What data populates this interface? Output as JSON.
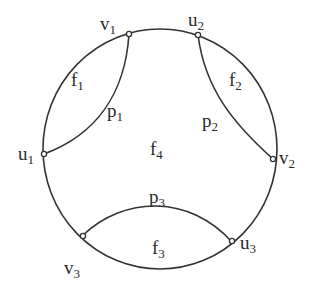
{
  "diagram": {
    "type": "planar graph on a circle",
    "outer_boundary": "circle",
    "colors": {
      "stroke": "#333333",
      "background": "#ffffff",
      "text": "#2a2a2a"
    },
    "nodes": [
      {
        "id": "v1",
        "base": "v",
        "sub": "1"
      },
      {
        "id": "u2",
        "base": "u",
        "sub": "2"
      },
      {
        "id": "u1",
        "base": "u",
        "sub": "1"
      },
      {
        "id": "v2",
        "base": "v",
        "sub": "2"
      },
      {
        "id": "v3",
        "base": "v",
        "sub": "3"
      },
      {
        "id": "u3",
        "base": "u",
        "sub": "3"
      }
    ],
    "paths": [
      {
        "id": "p1",
        "base": "p",
        "sub": "1",
        "from": "u1",
        "to": "v1"
      },
      {
        "id": "p2",
        "base": "p",
        "sub": "2",
        "from": "u2",
        "to": "v2"
      },
      {
        "id": "p3",
        "base": "p",
        "sub": "3",
        "from": "v3",
        "to": "u3"
      }
    ],
    "faces": [
      {
        "id": "f1",
        "base": "f",
        "sub": "1"
      },
      {
        "id": "f2",
        "base": "f",
        "sub": "2"
      },
      {
        "id": "f3",
        "base": "f",
        "sub": "3"
      },
      {
        "id": "f4",
        "base": "f",
        "sub": "4"
      }
    ]
  }
}
